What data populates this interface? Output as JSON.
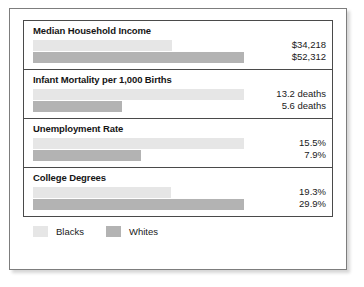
{
  "chart_data": {
    "type": "bar",
    "title": "",
    "xlabel": "",
    "ylabel": "",
    "grid": false,
    "orientation": "horizontal",
    "legend_position": "bottom-left",
    "categories": [
      "Median Household Income",
      "Infant Mortality per 1,000 Births",
      "Unemployment Rate",
      "College Degrees"
    ],
    "series": [
      {
        "name": "Blacks",
        "color": "#e6e6e6",
        "values": [
          34218,
          13.2,
          15.5,
          19.3
        ],
        "labels": [
          "$34,218",
          "13.2 deaths",
          "15.5%",
          "19.3%"
        ],
        "bar_fractions": [
          0.66,
          1.0,
          1.0,
          0.655
        ]
      },
      {
        "name": "Whites",
        "color": "#b3b3b3",
        "values": [
          52312,
          5.6,
          7.9,
          29.9
        ],
        "labels": [
          "$52,312",
          "5.6 deaths",
          "7.9%",
          "29.9%"
        ],
        "bar_fractions": [
          1.0,
          0.424,
          0.51,
          1.0
        ]
      }
    ],
    "panels": [
      {
        "title": "Median Household Income",
        "bars": [
          {
            "series": "Blacks",
            "label": "$34,218",
            "fraction": 0.66
          },
          {
            "series": "Whites",
            "label": "$52,312",
            "fraction": 1.0
          }
        ]
      },
      {
        "title": "Infant Mortality per 1,000 Births",
        "bars": [
          {
            "series": "Blacks",
            "label": "13.2 deaths",
            "fraction": 1.0
          },
          {
            "series": "Whites",
            "label": "5.6 deaths",
            "fraction": 0.424
          }
        ]
      },
      {
        "title": "Unemployment Rate",
        "bars": [
          {
            "series": "Blacks",
            "label": "15.5%",
            "fraction": 1.0
          },
          {
            "series": "Whites",
            "label": "7.9%",
            "fraction": 0.51
          }
        ]
      },
      {
        "title": "College Degrees",
        "bars": [
          {
            "series": "Blacks",
            "label": "19.3%",
            "fraction": 0.655
          },
          {
            "series": "Whites",
            "label": "29.9%",
            "fraction": 1.0
          }
        ]
      }
    ],
    "legend": [
      {
        "label": "Blacks",
        "color": "#e6e6e6"
      },
      {
        "label": "Whites",
        "color": "#b3b3b3"
      }
    ]
  }
}
